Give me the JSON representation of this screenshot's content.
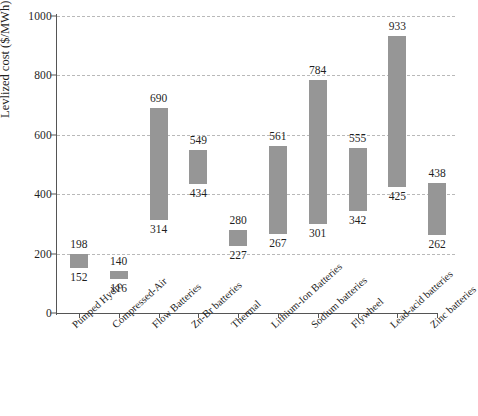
{
  "chart_data": {
    "type": "bar",
    "subtype": "floating-range-bar",
    "title": "",
    "xlabel": "",
    "ylabel": "Levlized cost ($/MWh)",
    "ylim": [
      0,
      1000
    ],
    "yticks": [
      0,
      200,
      400,
      600,
      800,
      1000
    ],
    "grid": true,
    "legend": null,
    "bar_color": "#969696",
    "grid_color": "#b9b9b9",
    "axis_color": "#555555",
    "categories": [
      "Pumped Hydro",
      "Compressed-Air",
      "Flow Batteries",
      "Zn-Br batteries",
      "Thermal",
      "Lithium-Ion Batteries",
      "Sodium batteries",
      "Flywheel",
      "Lead-acid batteries",
      "Zinc batteries"
    ],
    "series": [
      {
        "name": "low",
        "values": [
          152,
          116,
          314,
          434,
          227,
          267,
          301,
          342,
          425,
          262
        ]
      },
      {
        "name": "high",
        "values": [
          198,
          140,
          690,
          549,
          280,
          561,
          784,
          555,
          933,
          438
        ]
      }
    ],
    "bars": [
      {
        "category": "Pumped Hydro",
        "low": 152,
        "high": 198
      },
      {
        "category": "Compressed-Air",
        "low": 116,
        "high": 140
      },
      {
        "category": "Flow Batteries",
        "low": 314,
        "high": 690
      },
      {
        "category": "Zn-Br batteries",
        "low": 434,
        "high": 549
      },
      {
        "category": "Thermal",
        "low": 227,
        "high": 280
      },
      {
        "category": "Lithium-Ion Batteries",
        "low": 267,
        "high": 561
      },
      {
        "category": "Sodium batteries",
        "low": 301,
        "high": 784
      },
      {
        "category": "Flywheel",
        "low": 342,
        "high": 555
      },
      {
        "category": "Lead-acid batteries",
        "low": 425,
        "high": 933
      },
      {
        "category": "Zinc batteries",
        "low": 262,
        "high": 438
      }
    ]
  }
}
